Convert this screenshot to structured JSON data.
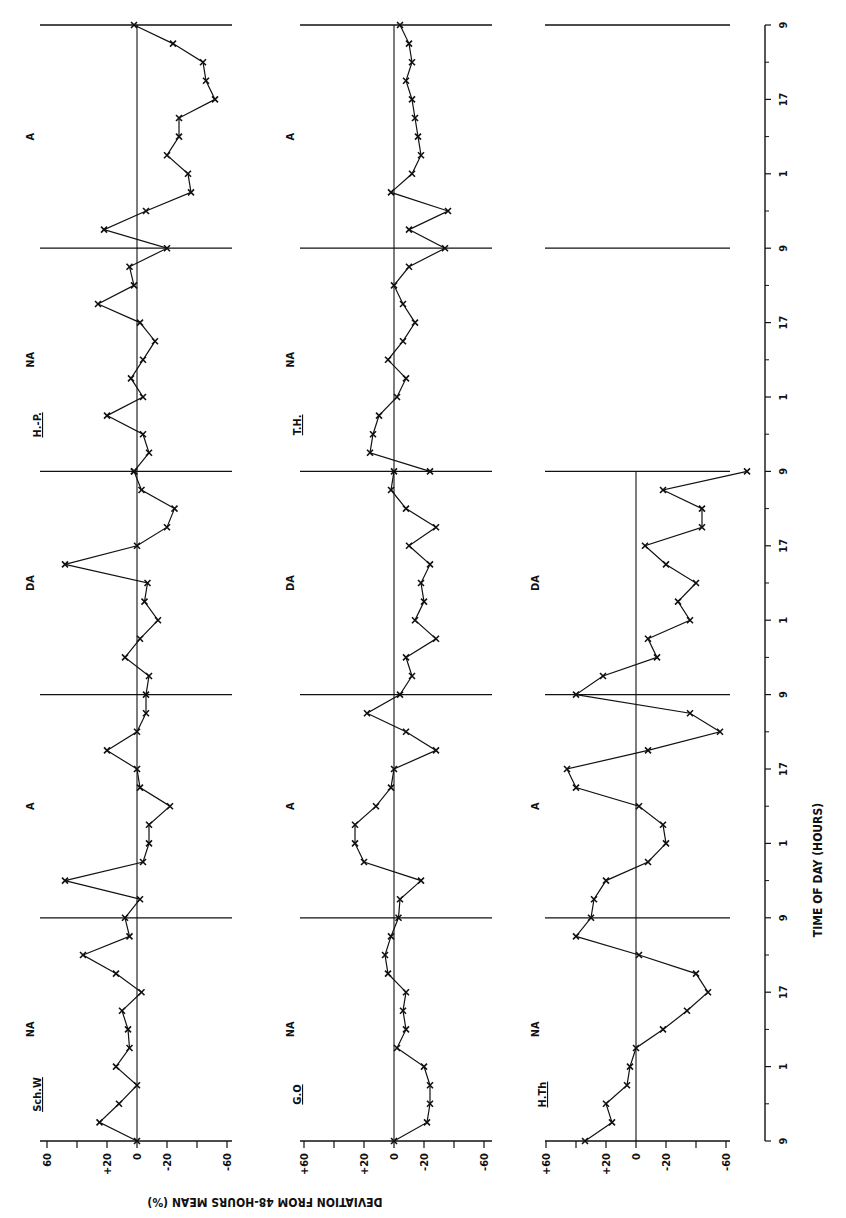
{
  "figure": {
    "orientation": "rotated-90-ccw",
    "y_axis_label": "DEVIATION FROM 48-HOURS MEAN (%)",
    "x_axis_label": "TIME OF DAY (HOURS)",
    "time_tick_labels": [
      "9",
      "1",
      "17",
      "9",
      "1",
      "17",
      "9",
      "1",
      "17",
      "9",
      "1",
      "17",
      "9",
      "1",
      "17",
      "9"
    ],
    "deviation_tick_labels_first": [
      "60",
      "+20",
      "0",
      "-20",
      "-60"
    ],
    "deviation_tick_labels": [
      "+60",
      "+20",
      "0",
      "-20",
      "-60"
    ],
    "phase_labels": [
      "NA",
      "A",
      "DA",
      "NA",
      "A",
      "DA"
    ],
    "line_color": "#111111",
    "background": "#ffffff"
  },
  "chart_data": {
    "type": "line",
    "title": "",
    "xlabel": "TIME OF DAY (HOURS)",
    "ylabel": "DEVIATION FROM 48-HOURS MEAN (%)",
    "ylim": [
      -60,
      60
    ],
    "x_ticks": [
      9,
      17,
      1,
      9,
      17,
      1,
      9,
      17,
      1,
      9,
      17,
      1,
      9,
      17,
      1,
      9
    ],
    "grid": false,
    "phases": [
      "NA",
      "A",
      "DA",
      "NA",
      "A",
      "DA"
    ],
    "panels": [
      {
        "subject": "Sch.W",
        "phase_groups": [
          "NA",
          "A",
          "DA"
        ],
        "hours": [
          0,
          2,
          4,
          6,
          8,
          10,
          12,
          14,
          16,
          18,
          20,
          22,
          24,
          26,
          28,
          30,
          32,
          34,
          36,
          38,
          40,
          42,
          44,
          46,
          48,
          50,
          52,
          54,
          56,
          58,
          60,
          62,
          64,
          66,
          68,
          70,
          72
        ],
        "values": [
          0,
          25,
          12,
          0,
          14,
          5,
          6,
          10,
          -3,
          14,
          36,
          5,
          8,
          -2,
          48,
          -4,
          -8,
          -8,
          -22,
          -2,
          0,
          20,
          0,
          -6,
          -6,
          -8,
          8,
          -2,
          -14,
          -5,
          -7,
          48,
          0,
          -20,
          -25,
          -3,
          2
        ]
      },
      {
        "subject": "Sch.W",
        "phase_groups": [
          "DA",
          "NA",
          "A",
          "DA"
        ],
        "hours": [
          72,
          74,
          76,
          78,
          80,
          82,
          84,
          86,
          88,
          90,
          92,
          94,
          96,
          98,
          100,
          102,
          104,
          106,
          108,
          110,
          112,
          114,
          116,
          118,
          120
        ],
        "values": [
          2,
          -8,
          -4,
          20,
          -4,
          4,
          -4,
          -12,
          -2,
          26,
          2,
          5,
          -20,
          22,
          -6,
          -36,
          -34,
          -20,
          -28,
          -28,
          -52,
          -46,
          -44,
          -24,
          2
        ]
      },
      {
        "subject": "G.O",
        "phase_groups": [
          "NA",
          "A",
          "DA"
        ],
        "hours": [
          0,
          2,
          4,
          6,
          8,
          10,
          12,
          14,
          16,
          18,
          20,
          22,
          24,
          26,
          28,
          30,
          32,
          34,
          36,
          38,
          40,
          42,
          44,
          46,
          48,
          50,
          52,
          54,
          56,
          58,
          60,
          62,
          64,
          66,
          68,
          70,
          72
        ],
        "values": [
          0,
          -22,
          -24,
          -24,
          -20,
          -2,
          -8,
          -6,
          -8,
          4,
          6,
          2,
          -3,
          -4,
          -18,
          20,
          26,
          26,
          12,
          2,
          0,
          -28,
          -8,
          18,
          -4,
          -12,
          -8,
          -28,
          -14,
          -20,
          -18,
          -24,
          -10,
          -28,
          -8,
          2,
          0
        ],
        "notes": "Smooth excursion to about -24% in first DA period"
      },
      {
        "subject": "T.H.",
        "phase_groups": [
          "NA",
          "A",
          "DA"
        ],
        "hours": [
          72,
          74,
          76,
          78,
          80,
          82,
          84,
          86,
          88,
          90,
          92,
          94,
          96,
          98,
          100,
          102,
          104,
          106,
          108,
          110,
          112,
          114,
          116,
          118,
          120
        ],
        "values": [
          -24,
          16,
          14,
          10,
          -2,
          -8,
          4,
          -6,
          -14,
          -6,
          0,
          -10,
          -34,
          -10,
          -36,
          2,
          -12,
          -18,
          -16,
          -14,
          -12,
          -8,
          -12,
          -10,
          -4
        ]
      },
      {
        "subject": "H.Th",
        "phase_groups": [
          "NA",
          "A",
          "DA"
        ],
        "hours": [
          0,
          2,
          4,
          6,
          8,
          10,
          12,
          14,
          16,
          18,
          20,
          22,
          24,
          26,
          28,
          30,
          32,
          34,
          36,
          38,
          40,
          42,
          44,
          46,
          48,
          50,
          52,
          54,
          56,
          58,
          60,
          62,
          64,
          66,
          68,
          70,
          72
        ],
        "values": [
          34,
          16,
          20,
          6,
          4,
          0,
          -18,
          -34,
          -48,
          -40,
          -2,
          40,
          30,
          28,
          20,
          -8,
          -20,
          -18,
          -2,
          40,
          46,
          -8,
          -56,
          -36,
          40,
          22,
          -14,
          -8,
          -36,
          -28,
          -40,
          -20,
          -6,
          -44,
          -44,
          -18,
          -74
        ]
      }
    ]
  }
}
